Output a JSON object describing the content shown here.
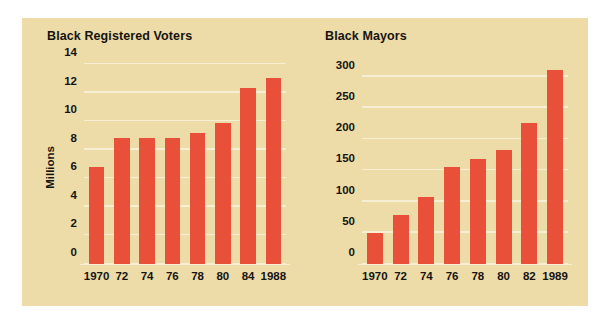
{
  "figure": {
    "background_color": "#EDDCA8",
    "bar_color": "#E8503A",
    "gridline_color": "#F7EFD4",
    "text_color": "#161412"
  },
  "chart_data": [
    {
      "type": "bar",
      "title": "Black Registered Voters",
      "xlabel": "",
      "ylabel": "Millions",
      "categories": [
        "1970",
        "72",
        "74",
        "76",
        "78",
        "80",
        "84",
        "1988"
      ],
      "values": [
        6.8,
        8.8,
        8.8,
        8.8,
        9.2,
        9.9,
        12.3,
        13.0
      ],
      "yticks": [
        0,
        2,
        4,
        6,
        8,
        10,
        12,
        14
      ],
      "ylim": [
        0,
        14
      ],
      "grid": true,
      "legend": false
    },
    {
      "type": "bar",
      "title": "Black Mayors",
      "xlabel": "",
      "ylabel": "",
      "categories": [
        "1970",
        "72",
        "74",
        "76",
        "78",
        "80",
        "82",
        "1989"
      ],
      "values": [
        50,
        78,
        107,
        156,
        168,
        182,
        225,
        310
      ],
      "yticks": [
        0,
        50,
        100,
        150,
        200,
        250,
        300
      ],
      "ylim": [
        0,
        320
      ],
      "grid": true,
      "legend": false
    }
  ]
}
